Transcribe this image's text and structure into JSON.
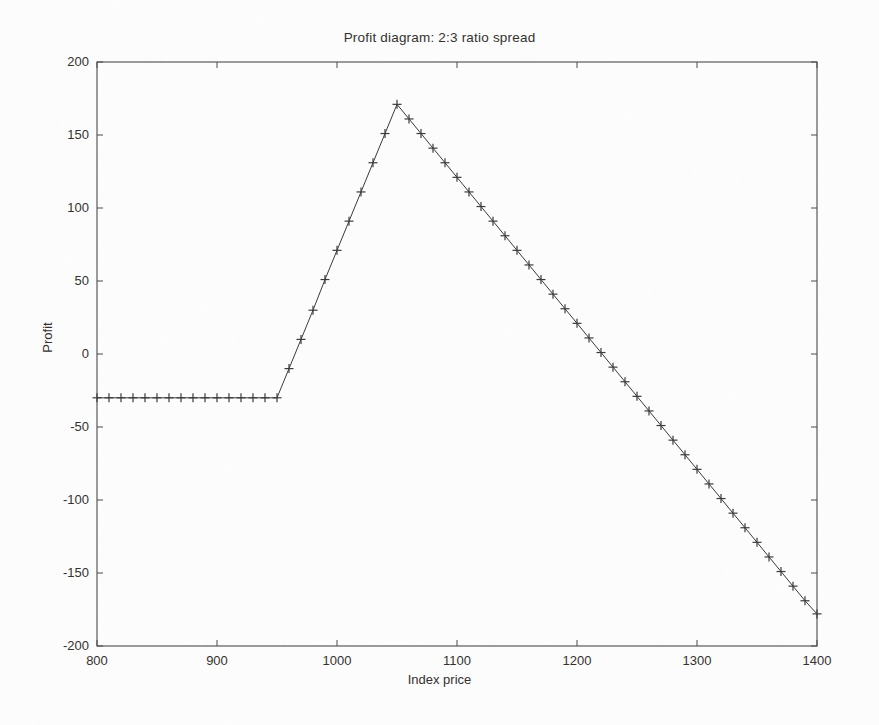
{
  "chart_data": {
    "type": "line",
    "title": "Profit diagram: 2:3 ratio spread",
    "xlabel": "Index price",
    "ylabel": "Profit",
    "xlim": [
      800,
      1400
    ],
    "ylim": [
      -200,
      200
    ],
    "xticks": [
      800,
      900,
      1000,
      1100,
      1200,
      1300,
      1400
    ],
    "xticklabels": [
      "800",
      "900",
      "1000",
      "1100",
      "1200",
      "1300",
      "1400"
    ],
    "yticks": [
      -200,
      -150,
      -100,
      -50,
      0,
      50,
      100,
      150,
      200
    ],
    "yticklabels": [
      "-200",
      "-150",
      "-100",
      "-50",
      "0",
      "50",
      "100",
      "150",
      "200"
    ],
    "grid": false,
    "legend": null,
    "marker": "plus",
    "line_color": "#3a3a3a",
    "series": [
      {
        "name": "Profit",
        "x": [
          800,
          810,
          820,
          830,
          840,
          850,
          860,
          870,
          880,
          890,
          900,
          910,
          920,
          930,
          940,
          950,
          960,
          970,
          980,
          990,
          1000,
          1010,
          1020,
          1030,
          1040,
          1050,
          1060,
          1070,
          1080,
          1090,
          1100,
          1110,
          1120,
          1130,
          1140,
          1150,
          1160,
          1170,
          1180,
          1190,
          1200,
          1210,
          1220,
          1230,
          1240,
          1250,
          1260,
          1270,
          1280,
          1290,
          1300,
          1310,
          1320,
          1330,
          1340,
          1350,
          1360,
          1370,
          1380,
          1390,
          1400
        ],
        "y": [
          -30,
          -30,
          -30,
          -30,
          -30,
          -30,
          -30,
          -30,
          -30,
          -30,
          -30,
          -30,
          -30,
          -30,
          -30,
          -30,
          -10,
          10,
          30,
          51,
          71,
          91,
          111,
          131,
          151,
          171,
          161,
          151,
          141,
          131,
          121,
          111,
          101,
          91,
          81,
          71,
          61,
          51,
          41,
          31,
          21,
          11,
          1,
          -9,
          -19,
          -29,
          -39,
          -49,
          -59,
          -69,
          -79,
          -89,
          -99,
          -109,
          -119,
          -129,
          -139,
          -149,
          -159,
          -169,
          -178
        ]
      }
    ],
    "annotations": {
      "flat_region_value": -30,
      "flat_region_end": 950,
      "peak_price": 1050,
      "peak_profit": 171,
      "breakeven_upper": 1221,
      "end_profit": -178
    }
  },
  "figure": {
    "background_color": "#fdfdfd",
    "axis_color": "#4a4a4a"
  }
}
